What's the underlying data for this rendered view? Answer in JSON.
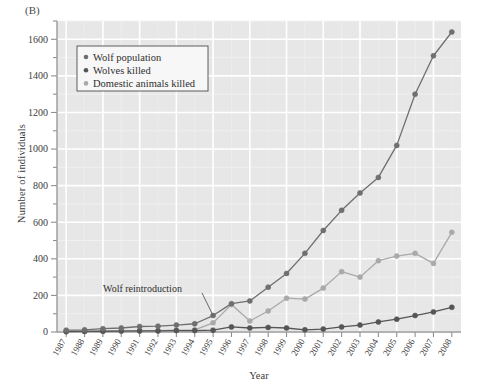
{
  "figure": {
    "panel_label": "(B)",
    "xlabel": "Year",
    "ylabel": "Number of individuals"
  },
  "legend": {
    "items": [
      {
        "label": "Wolf population",
        "color": "#6f6f6f",
        "marker": "dot-marker"
      },
      {
        "label": "Wolves killed",
        "color": "#555555",
        "marker": "dot-marker"
      },
      {
        "label": "Domestic animals killed",
        "color": "#a9a9a9",
        "marker": "dot-marker"
      }
    ]
  },
  "annotations": [
    {
      "text": "Wolf reintroduction",
      "name": "wolf-reintroduction-annotation"
    }
  ],
  "colors": {
    "plot_background": "#e7e7e7",
    "gridline": "#ffffff",
    "axis": "#9a9a9a",
    "wolf_population": "#6f6f6f",
    "wolves_killed": "#555555",
    "domestic_animals_killed": "#a9a9a9"
  },
  "chart_data": {
    "type": "line",
    "title": "",
    "xlabel": "Year",
    "ylabel": "Number of individuals",
    "grid": true,
    "legend_position": "top-left",
    "xlim": [
      1987,
      2008
    ],
    "ylim": [
      0,
      1700
    ],
    "yticks": [
      0,
      200,
      400,
      600,
      800,
      1000,
      1200,
      1400,
      1600
    ],
    "yminor_step": 100,
    "categories": [
      1987,
      1988,
      1989,
      1990,
      1991,
      1992,
      1993,
      1994,
      1995,
      1996,
      1997,
      1998,
      1999,
      2000,
      2001,
      2002,
      2003,
      2004,
      2005,
      2006,
      2007,
      2008
    ],
    "series": [
      {
        "name": "Wolf population",
        "color": "#6f6f6f",
        "values": [
          10,
          12,
          18,
          22,
          30,
          32,
          38,
          45,
          90,
          155,
          170,
          245,
          320,
          430,
          555,
          665,
          760,
          845,
          1020,
          1300,
          1510,
          1640
        ]
      },
      {
        "name": "Wolves killed",
        "color": "#555555",
        "values": [
          2,
          3,
          4,
          5,
          6,
          6,
          8,
          8,
          10,
          28,
          22,
          25,
          22,
          12,
          16,
          28,
          38,
          55,
          70,
          90,
          110,
          135
        ]
      },
      {
        "name": "Domestic animals killed",
        "color": "#a9a9a9",
        "values": [
          3,
          4,
          5,
          6,
          7,
          8,
          10,
          12,
          50,
          150,
          60,
          115,
          185,
          180,
          240,
          330,
          300,
          390,
          415,
          430,
          375,
          545
        ]
      }
    ],
    "xtick_labels": [
      "1987",
      "1988",
      "1989",
      "1990",
      "1991",
      "1992",
      "1993",
      "1994",
      "1995",
      "1996",
      "1997",
      "1998",
      "1999",
      "2000",
      "2001",
      "2002",
      "2003",
      "2004",
      "2005",
      "2006",
      "2007",
      "2008"
    ]
  }
}
